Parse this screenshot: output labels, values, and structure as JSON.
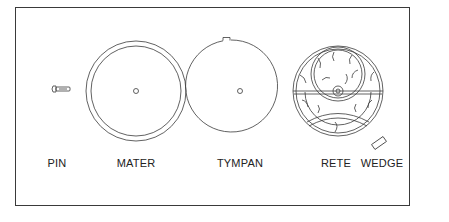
{
  "diagram": {
    "parts": [
      {
        "id": "pin",
        "label": "PIN"
      },
      {
        "id": "mater",
        "label": "MATER"
      },
      {
        "id": "tympan",
        "label": "TYMPAN"
      },
      {
        "id": "rete",
        "label": "RETE"
      },
      {
        "id": "wedge",
        "label": "WEDGE"
      }
    ]
  },
  "colors": {
    "line": "#3a3a3a",
    "background": "#ffffff"
  }
}
